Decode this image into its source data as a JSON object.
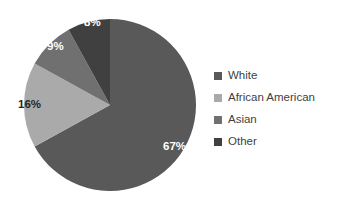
{
  "chart_data": {
    "type": "pie",
    "title": "",
    "categories": [
      "White",
      "African American",
      "Asian",
      "Other"
    ],
    "values": [
      67,
      16,
      9,
      8
    ],
    "labels": [
      "67%",
      "16%",
      "9%",
      "8%"
    ],
    "colors": [
      "#595959",
      "#aaaaaa",
      "#707070",
      "#404040"
    ],
    "label_colors": [
      "#ffffff",
      "#262626",
      "#ffffff",
      "#ffffff"
    ],
    "units": "percent",
    "start_angle_deg": 0,
    "direction": "clockwise",
    "legend_position": "right",
    "grid": false,
    "background": "#ffffff"
  },
  "pie": {
    "slices": [
      {
        "name": "White",
        "label": "67%",
        "value": 67,
        "color": "#595959"
      },
      {
        "name": "African American",
        "label": "16%",
        "value": 16,
        "color": "#aaaaaa"
      },
      {
        "name": "Asian",
        "label": "9%",
        "value": 9,
        "color": "#707070"
      },
      {
        "name": "Other",
        "label": "8%",
        "value": 8,
        "color": "#404040"
      }
    ]
  },
  "legend": {
    "items": [
      {
        "label": "White",
        "color": "#595959",
        "swatch_icon": "square-swatch-icon"
      },
      {
        "label": "African American",
        "color": "#aaaaaa",
        "swatch_icon": "square-swatch-icon"
      },
      {
        "label": "Asian",
        "color": "#707070",
        "swatch_icon": "square-swatch-icon"
      },
      {
        "label": "Other",
        "color": "#404040",
        "swatch_icon": "square-swatch-icon"
      }
    ]
  }
}
